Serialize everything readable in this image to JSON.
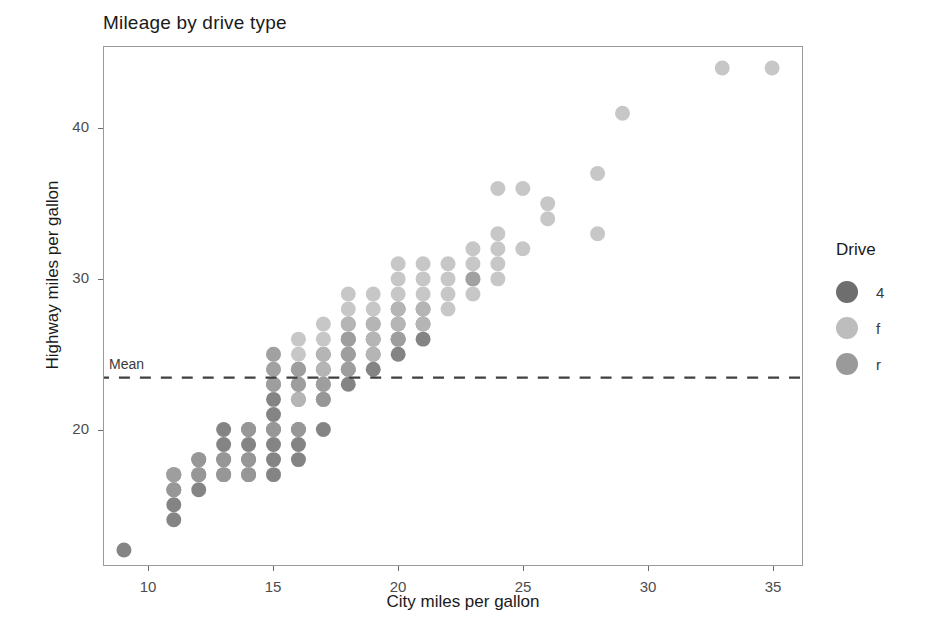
{
  "chart_data": {
    "type": "scatter",
    "title": "Mileage by drive type",
    "xlabel": "City miles per gallon",
    "ylabel": "Highway miles per gallon",
    "xlim": [
      8.2,
      36.2
    ],
    "ylim": [
      11.0,
      45.4
    ],
    "xticks": [
      10,
      15,
      20,
      25,
      30,
      35
    ],
    "yticks": [
      20,
      30,
      40
    ],
    "grid": false,
    "legend": {
      "position": "right",
      "title": "Drive",
      "entries": [
        {
          "label": "4",
          "color": "#6e6e6e"
        },
        {
          "label": "f",
          "color": "#bdbdbd"
        },
        {
          "label": "r",
          "color": "#9a9a9a"
        }
      ]
    },
    "annotations": [
      {
        "name": "mean-line",
        "type": "hline",
        "label": "Mean",
        "y": 23.44,
        "style": "dashed",
        "color": "#404040"
      }
    ],
    "point_style": {
      "radius": 7.5,
      "opacity": 0.85
    },
    "series": [
      {
        "name": "4",
        "color": "#6e6e6e",
        "points": [
          [
            9,
            12
          ],
          [
            11,
            14
          ],
          [
            11,
            15
          ],
          [
            11,
            16
          ],
          [
            11,
            17
          ],
          [
            12,
            16
          ],
          [
            12,
            17
          ],
          [
            12,
            18
          ],
          [
            13,
            17
          ],
          [
            13,
            18
          ],
          [
            13,
            19
          ],
          [
            13,
            20
          ],
          [
            14,
            17
          ],
          [
            14,
            18
          ],
          [
            14,
            19
          ],
          [
            14,
            20
          ],
          [
            15,
            17
          ],
          [
            15,
            18
          ],
          [
            15,
            19
          ],
          [
            15,
            20
          ],
          [
            15,
            21
          ],
          [
            15,
            22
          ],
          [
            15,
            23
          ],
          [
            16,
            18
          ],
          [
            16,
            19
          ],
          [
            16,
            20
          ],
          [
            16,
            22
          ],
          [
            16,
            23
          ],
          [
            16,
            24
          ],
          [
            17,
            20
          ],
          [
            17,
            22
          ],
          [
            17,
            23
          ],
          [
            17,
            24
          ],
          [
            17,
            25
          ],
          [
            18,
            23
          ],
          [
            18,
            24
          ],
          [
            18,
            25
          ],
          [
            18,
            26
          ],
          [
            18,
            27
          ],
          [
            19,
            24
          ],
          [
            19,
            25
          ],
          [
            19,
            26
          ],
          [
            19,
            27
          ],
          [
            20,
            25
          ],
          [
            20,
            26
          ],
          [
            20,
            27
          ],
          [
            20,
            28
          ],
          [
            21,
            26
          ],
          [
            21,
            27
          ],
          [
            21,
            28
          ]
        ]
      },
      {
        "name": "f",
        "color": "#bdbdbd",
        "points": [
          [
            11,
            17
          ],
          [
            15,
            23
          ],
          [
            15,
            24
          ],
          [
            15,
            25
          ],
          [
            16,
            22
          ],
          [
            16,
            23
          ],
          [
            16,
            24
          ],
          [
            16,
            25
          ],
          [
            16,
            26
          ],
          [
            17,
            23
          ],
          [
            17,
            24
          ],
          [
            17,
            25
          ],
          [
            17,
            26
          ],
          [
            17,
            27
          ],
          [
            18,
            24
          ],
          [
            18,
            25
          ],
          [
            18,
            26
          ],
          [
            18,
            27
          ],
          [
            18,
            28
          ],
          [
            18,
            29
          ],
          [
            19,
            25
          ],
          [
            19,
            26
          ],
          [
            19,
            27
          ],
          [
            19,
            28
          ],
          [
            19,
            29
          ],
          [
            20,
            26
          ],
          [
            20,
            27
          ],
          [
            20,
            28
          ],
          [
            20,
            29
          ],
          [
            20,
            30
          ],
          [
            20,
            31
          ],
          [
            21,
            27
          ],
          [
            21,
            28
          ],
          [
            21,
            29
          ],
          [
            21,
            30
          ],
          [
            21,
            31
          ],
          [
            22,
            28
          ],
          [
            22,
            29
          ],
          [
            22,
            30
          ],
          [
            22,
            31
          ],
          [
            23,
            29
          ],
          [
            23,
            30
          ],
          [
            23,
            31
          ],
          [
            23,
            32
          ],
          [
            24,
            30
          ],
          [
            24,
            31
          ],
          [
            24,
            32
          ],
          [
            24,
            33
          ],
          [
            24,
            36
          ],
          [
            25,
            32
          ],
          [
            25,
            36
          ],
          [
            26,
            34
          ],
          [
            26,
            35
          ],
          [
            28,
            33
          ],
          [
            28,
            37
          ],
          [
            29,
            41
          ],
          [
            33,
            44
          ],
          [
            35,
            44
          ]
        ]
      },
      {
        "name": "r",
        "color": "#9a9a9a",
        "points": [
          [
            11,
            16
          ],
          [
            11,
            17
          ],
          [
            12,
            17
          ],
          [
            12,
            18
          ],
          [
            13,
            17
          ],
          [
            13,
            18
          ],
          [
            14,
            17
          ],
          [
            14,
            18
          ],
          [
            14,
            20
          ],
          [
            15,
            20
          ],
          [
            15,
            23
          ],
          [
            15,
            24
          ],
          [
            15,
            25
          ],
          [
            16,
            20
          ],
          [
            16,
            23
          ],
          [
            16,
            24
          ],
          [
            17,
            22
          ],
          [
            17,
            23
          ],
          [
            18,
            24
          ],
          [
            18,
            25
          ],
          [
            18,
            26
          ],
          [
            20,
            26
          ],
          [
            23,
            30
          ]
        ]
      }
    ]
  },
  "axis": {
    "y_tick_labels": [
      "20",
      "30",
      "40"
    ],
    "x_tick_labels": [
      "10",
      "15",
      "20",
      "25",
      "30",
      "35"
    ]
  }
}
